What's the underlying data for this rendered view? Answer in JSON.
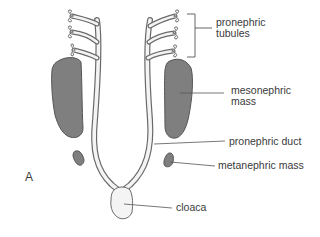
{
  "figure": {
    "panel_letter": "A",
    "colors": {
      "outline": "#6a6a6a",
      "duct_fill": "#f4f4f4",
      "mass_fill": "#7f7f7f",
      "leader": "#555555",
      "text": "#3a3a3a"
    },
    "labels": {
      "pronephric_tubules": [
        "pronephric",
        "tubules"
      ],
      "mesonephric_mass": [
        "mesonephric",
        "mass"
      ],
      "pronephric_duct": "pronephric duct",
      "metanephric_mass": "metanephric mass",
      "cloaca": "cloaca"
    }
  }
}
